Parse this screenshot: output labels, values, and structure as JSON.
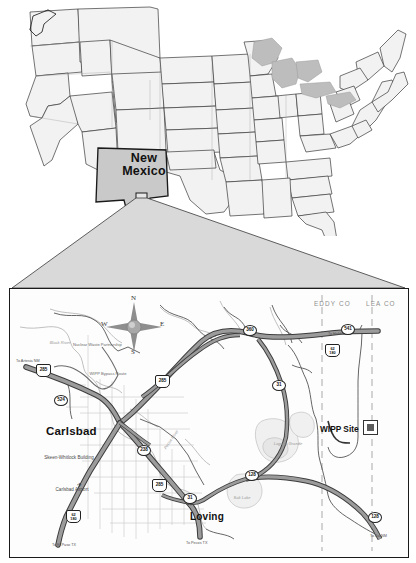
{
  "figure": {
    "type": "locator-map"
  },
  "us_map": {
    "highlighted_state": "New Mexico",
    "highlight_fill": "#c9c9c9",
    "state_fill": "#f2f2f2",
    "lakes_fill": "#bdbdbd",
    "outline_color": "#333333",
    "callout_box_label": ""
  },
  "detail_map": {
    "counties": [
      {
        "name": "EDDY CO"
      },
      {
        "name": "LEA CO"
      }
    ],
    "cities": [
      {
        "name": "Carlsbad",
        "size": "big"
      },
      {
        "name": "Loving",
        "size": "mid"
      }
    ],
    "sites": [
      {
        "name": "WIPP Site",
        "marker": "square-site-marker"
      }
    ],
    "places": [
      {
        "name": "Skeen-Whitlock Building"
      },
      {
        "name": "Carlsbad Airport"
      },
      {
        "name": "Nuclear Waste Partnership"
      },
      {
        "name": "WIPP Bypass Route"
      }
    ],
    "water_features": [
      {
        "name": "Pecos River"
      },
      {
        "name": "Laguna Grande"
      },
      {
        "name": "Salt Lake"
      },
      {
        "name": "Black River"
      }
    ],
    "highways": [
      {
        "label": "285",
        "type": "us-shield",
        "name": "us-285-shield-northwest"
      },
      {
        "label": "285",
        "type": "us-shield",
        "name": "us-285-shield-carlsbad"
      },
      {
        "label": "285",
        "type": "us-shield",
        "name": "us-285-shield-south"
      },
      {
        "label": "62\n180",
        "type": "us-shield-two",
        "name": "us-62-180-shield-east"
      },
      {
        "label": "62\n180",
        "type": "us-shield-two",
        "name": "us-62-180-shield-southwest"
      },
      {
        "label": "524",
        "type": "nm-circle",
        "name": "nm-524-marker"
      },
      {
        "label": "360",
        "type": "nm-circle",
        "name": "nm-360-marker"
      },
      {
        "label": "31",
        "type": "nm-circle",
        "name": "nm-31-marker-north"
      },
      {
        "label": "31",
        "type": "nm-circle",
        "name": "nm-31-marker-loving"
      },
      {
        "label": "128",
        "type": "nm-circle",
        "name": "nm-128-marker-west"
      },
      {
        "label": "128",
        "type": "nm-circle",
        "name": "nm-128-marker-southeast"
      },
      {
        "label": "238",
        "type": "nm-circle",
        "name": "nm-238-marker"
      },
      {
        "label": "541",
        "type": "nm-circle",
        "name": "nm-541-marker"
      }
    ],
    "destination_labels": [
      {
        "text": "To Artesia NM",
        "name": "to-artesia-nm-label"
      },
      {
        "text": "To Hobbs NM",
        "name": "to-hobbs-nm-label"
      },
      {
        "text": "To El Paso TX",
        "name": "to-el-paso-tx-label"
      },
      {
        "text": "To Pecos TX",
        "name": "to-pecos-tx-label"
      },
      {
        "text": "To Jal NM",
        "name": "to-jal-nm-label"
      }
    ],
    "compass": {
      "north": "N",
      "south": "S",
      "east": "E",
      "west": "W"
    }
  }
}
